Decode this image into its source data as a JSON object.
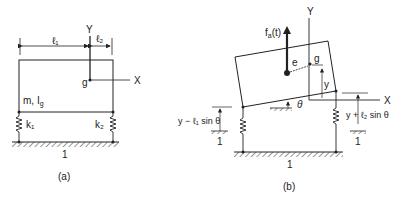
{
  "figure_a": {
    "label": "(a)",
    "dim_l1": "ℓ₁",
    "dim_l2": "ℓ₂",
    "axis_y": "Y",
    "axis_x": "X",
    "cg": "g",
    "mass": "m, I",
    "mass_sub": "g",
    "spring_left": "k₁",
    "spring_right": "k₂",
    "ground": "1"
  },
  "figure_b": {
    "label": "(b)",
    "force": "f",
    "force_sub": "a",
    "force_arg": "(t)",
    "axis_y": "Y",
    "axis_x": "X",
    "cg": "g",
    "eccentricity": "e",
    "disp_y": "y",
    "theta": "θ",
    "left_disp": "y − ℓ₁ sin θ",
    "right_disp": "y + ℓ₂ sin θ",
    "ground_left": "1",
    "ground_right": "1",
    "ground_main": "1"
  }
}
